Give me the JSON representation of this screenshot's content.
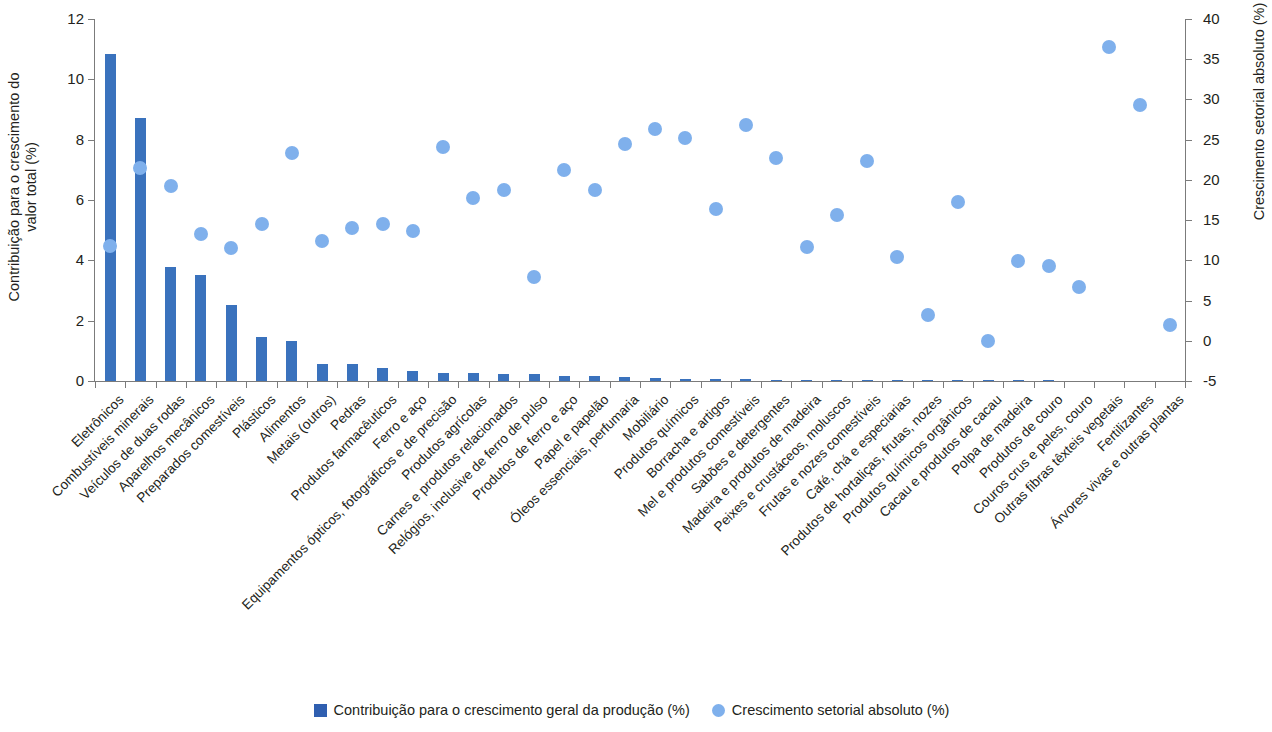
{
  "chart_data": {
    "type": "bar",
    "title": "",
    "subtitle": "",
    "xlabel": "",
    "ylabel": "Contribuição para o crescimento do\nvalor total (%)",
    "y2label": "Crescimento setorial absoluto (%)",
    "ylim": [
      0,
      12
    ],
    "y2lim": [
      -5,
      40
    ],
    "yticks": [
      "0",
      "2",
      "4",
      "6",
      "8",
      "10",
      "12"
    ],
    "ytick_values": [
      0,
      2,
      4,
      6,
      8,
      10,
      12
    ],
    "y2ticks": [
      "-5",
      "0",
      "5",
      "10",
      "15",
      "20",
      "25",
      "30",
      "35",
      "40"
    ],
    "y2tick_values": [
      -5,
      0,
      5,
      10,
      15,
      20,
      25,
      30,
      35,
      40
    ],
    "grid": false,
    "legend_position": "bottom-center",
    "categories": [
      "Eletrônicos",
      "Combustíveis minerais",
      "Veículos de duas rodas",
      "Aparelhos mecânicos",
      "Preparados comestíveis",
      "Plásticos",
      "Alimentos",
      "Metais (outros)",
      "Pedras",
      "Produtos farmacêuticos",
      "Ferro e aço",
      "Equipamentos ópticos, fotográficos e de precisão",
      "Produtos agrícolas",
      "Carnes e produtos relacionados",
      "Relógios, inclusive de ferro de pulso",
      "Produtos de ferro e aço",
      "Papel e papelão",
      "Óleos essenciais, perfumaria",
      "Mobiliário",
      "Produtos químicos",
      "Borracha e artigos",
      "Mel e produtos comestíveis",
      "Sabões e detergentes",
      "Madeira e produtos de madeira",
      "Peixes e crustáceos, moluscos",
      "Frutas e nozes comestíveis",
      "Café, chá e especiarias",
      "Produtos de hortaliças, frutas, nozes",
      "Produtos químicos orgânicos",
      "Cacau e produtos de cacau",
      "Polpa de madeira",
      "Produtos de couro",
      "Couros crus e peles, couro",
      "Outras fibras têxteis vegetais",
      "Fertilizantes",
      "Árvores vivas e outras plantas"
    ],
    "series": [
      {
        "name": "Contribuição para o crescimento geral da produção (%)",
        "axis": "left",
        "color": "#3a72bd",
        "type": "bar",
        "values": [
          10.85,
          8.72,
          3.78,
          3.5,
          2.52,
          1.45,
          1.33,
          0.58,
          0.57,
          0.44,
          0.33,
          0.27,
          0.26,
          0.24,
          0.22,
          0.18,
          0.15,
          0.12,
          0.1,
          0.08,
          0.07,
          0.06,
          0.05,
          0.04,
          0.03,
          0.03,
          0.02,
          0.02,
          0.01,
          0.01,
          0.01,
          0.01,
          0.0,
          0.0,
          0.0,
          0.0
        ]
      },
      {
        "name": "Crescimento setorial absoluto (%)",
        "axis": "right",
        "color": "#7fb0ec",
        "type": "scatter",
        "values": [
          11.8,
          21.5,
          19.3,
          13.3,
          11.5,
          14.5,
          23.3,
          12.4,
          14.0,
          14.5,
          13.7,
          24.1,
          17.8,
          18.7,
          7.9,
          21.2,
          18.7,
          24.4,
          26.3,
          25.2,
          16.4,
          26.8,
          22.7,
          11.7,
          15.6,
          22.3,
          10.4,
          3.2,
          17.2,
          0.0,
          9.9,
          9.3,
          6.7,
          36.5,
          29.3,
          2.0
        ]
      }
    ]
  },
  "legend": {
    "items": [
      {
        "label": "Contribuição para o crescimento geral da produção (%)",
        "marker": "square",
        "color": "#2f5fb0"
      },
      {
        "label": "Crescimento setorial absoluto (%)",
        "marker": "circle",
        "color": "#7fb0ec"
      }
    ]
  }
}
